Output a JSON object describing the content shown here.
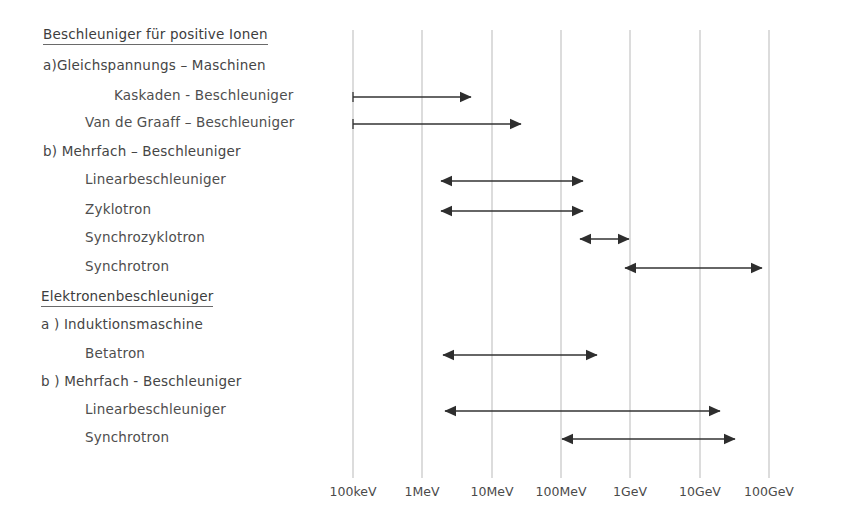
{
  "figure": {
    "title_group_1": "Beschleuniger für positive Ionen",
    "title_group_2": "Elektronenbeschleuniger",
    "section_ion_a": "a)Gleichspannungs – Maschinen",
    "section_ion_b": "b) Mehrfach – Beschleuniger",
    "section_el_a": "a ) Induktionsmaschine",
    "section_el_b": "b ) Mehrfach - Beschleuniger",
    "row_labels": {
      "kaskaden": "Kaskaden - Beschleuniger",
      "vandegraaff": "Van de Graaff – Beschleuniger",
      "linac_ion": "Linearbeschleuniger",
      "zyklotron": "Zyklotron",
      "synchrozyklotron": "Synchrozyklotron",
      "synchrotron_ion": "Synchrotron",
      "betatron": "Betatron",
      "linac_el": "Linearbeschleuniger",
      "synchrotron_el": "Synchrotron"
    }
  },
  "chart_data": {
    "type": "bar",
    "xlabel": "Energie",
    "ylabel": "",
    "grid": true,
    "legend_position": "none",
    "x_scale": "log",
    "x_tick_labels": [
      "100keV",
      "1MeV",
      "10MeV",
      "100MeV",
      "1GeV",
      "10GeV",
      "100GeV"
    ],
    "x_tick_values_eV": [
      100000,
      1000000,
      10000000,
      100000000,
      1000000000,
      10000000000,
      100000000000
    ],
    "x_tick_px": [
      353,
      422,
      492,
      561,
      630,
      700,
      769
    ],
    "xlim_px": [
      353,
      769
    ],
    "categories": [
      "Kaskaden - Beschleuniger",
      "Van de Graaff – Beschleuniger",
      "Linearbeschleuniger (Ionen)",
      "Zyklotron",
      "Synchrozyklotron",
      "Synchrotron (Ionen)",
      "Betatron",
      "Linearbeschleuniger (Elektronen)",
      "Synchrotron (Elektronen)"
    ],
    "ranges": [
      {
        "label": "Kaskaden - Beschleuniger",
        "y_px": 97,
        "x_start_px": 353,
        "x_end_px": 471,
        "arrow_start": false,
        "arrow_end": true,
        "start_cap": true,
        "start_label": "100keV",
        "end_label": "~4MeV"
      },
      {
        "label": "Van de Graaff – Beschleuniger",
        "y_px": 124,
        "x_start_px": 353,
        "x_end_px": 521,
        "arrow_start": false,
        "arrow_end": true,
        "start_cap": true,
        "start_label": "100keV",
        "end_label": "~25MeV"
      },
      {
        "label": "Linearbeschleuniger (Ionen)",
        "y_px": 181,
        "x_start_px": 441,
        "x_end_px": 583,
        "arrow_start": true,
        "arrow_end": true,
        "start_cap": false,
        "start_label": "~4MeV",
        "end_label": "~300MeV"
      },
      {
        "label": "Zyklotron",
        "y_px": 211,
        "x_start_px": 441,
        "x_end_px": 583,
        "arrow_start": true,
        "arrow_end": true,
        "start_cap": false,
        "start_label": "~4MeV",
        "end_label": "~300MeV"
      },
      {
        "label": "Synchrozyklotron",
        "y_px": 239,
        "x_start_px": 580,
        "x_end_px": 629,
        "arrow_start": true,
        "arrow_end": true,
        "start_cap": false,
        "start_label": "~250MeV",
        "end_label": "~1GeV"
      },
      {
        "label": "Synchrotron (Ionen)",
        "y_px": 268,
        "x_start_px": 625,
        "x_end_px": 762,
        "arrow_start": true,
        "arrow_end": true,
        "start_cap": false,
        "start_label": "~900MeV",
        "end_label": "~80GeV"
      },
      {
        "label": "Betatron",
        "y_px": 355,
        "x_start_px": 443,
        "x_end_px": 597,
        "arrow_start": true,
        "arrow_end": true,
        "start_cap": false,
        "start_label": "~5MeV",
        "end_label": "~500MeV"
      },
      {
        "label": "Linearbeschleuniger (Elektronen)",
        "y_px": 411,
        "x_start_px": 445,
        "x_end_px": 720,
        "arrow_start": true,
        "arrow_end": true,
        "start_cap": false,
        "start_label": "~5MeV",
        "end_label": "~20GeV"
      },
      {
        "label": "Synchrotron (Elektronen)",
        "y_px": 439,
        "x_start_px": 562,
        "x_end_px": 735,
        "arrow_start": true,
        "arrow_end": true,
        "start_cap": false,
        "start_label": "~100MeV",
        "end_label": "~35GeV"
      }
    ]
  },
  "colors": {
    "line": "#333333",
    "grid": "#b9b9b9",
    "text": "#4a4a4a",
    "background": "#ffffff"
  }
}
